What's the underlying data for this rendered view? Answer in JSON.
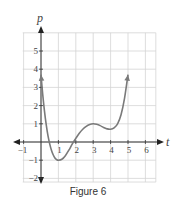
{
  "chart_data": {
    "type": "line",
    "title": "",
    "caption": "Figure 6",
    "xlabel": "t",
    "ylabel": "p",
    "xlim": [
      -1,
      6
    ],
    "ylim": [
      -2,
      6
    ],
    "grid": true,
    "x_ticks": [
      -1,
      1,
      2,
      3,
      4,
      5,
      6
    ],
    "y_ticks": [
      -2,
      -1,
      1,
      2,
      3,
      4,
      5
    ],
    "series": [
      {
        "name": "p(t)",
        "color": "#7a7a7a",
        "arrows": "both-ends",
        "points": [
          [
            0.0,
            3.7
          ],
          [
            0.1,
            2.6
          ],
          [
            0.2,
            1.7
          ],
          [
            0.3,
            0.95
          ],
          [
            0.4,
            0.35
          ],
          [
            0.5,
            -0.1
          ],
          [
            0.6,
            -0.45
          ],
          [
            0.7,
            -0.7
          ],
          [
            0.8,
            -0.88
          ],
          [
            0.9,
            -0.97
          ],
          [
            1.0,
            -1.0
          ],
          [
            1.2,
            -0.95
          ],
          [
            1.4,
            -0.75
          ],
          [
            1.6,
            -0.45
          ],
          [
            1.8,
            -0.1
          ],
          [
            2.0,
            0.2
          ],
          [
            2.2,
            0.48
          ],
          [
            2.4,
            0.7
          ],
          [
            2.6,
            0.86
          ],
          [
            2.8,
            0.96
          ],
          [
            3.0,
            1.0
          ],
          [
            3.2,
            0.97
          ],
          [
            3.4,
            0.9
          ],
          [
            3.6,
            0.8
          ],
          [
            3.8,
            0.72
          ],
          [
            4.0,
            0.7
          ],
          [
            4.2,
            0.78
          ],
          [
            4.4,
            1.0
          ],
          [
            4.6,
            1.5
          ],
          [
            4.8,
            2.4
          ],
          [
            5.0,
            3.7
          ]
        ]
      }
    ]
  },
  "caption": "Figure 6"
}
